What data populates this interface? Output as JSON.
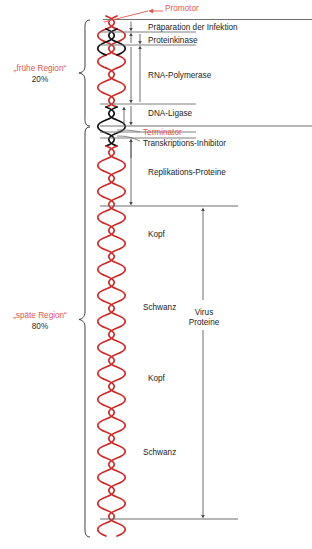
{
  "figure": {
    "type": "schematic-diagram",
    "caption": ""
  },
  "regions": [
    {
      "id": "early",
      "name": "„frühe Region“",
      "percent": "20%",
      "color": "#e0574f"
    },
    {
      "id": "late",
      "name": "„späte Region“",
      "percent": "80%",
      "color": "#e0574f"
    }
  ],
  "signals": [
    {
      "id": "promotor",
      "label": "Promotor",
      "color": "#e0574f"
    },
    {
      "id": "terminator",
      "label": "Terminator",
      "color": "#e0574f"
    }
  ],
  "gene_labels": [
    {
      "id": "praeparation",
      "label": "Präparation der Infektion"
    },
    {
      "id": "proteinkinase",
      "label": "Proteinkinase"
    },
    {
      "id": "rna-polymerase",
      "label": "RNA-Polymerase"
    },
    {
      "id": "dna-ligase",
      "label": "DNA-Ligase"
    },
    {
      "id": "transkriptions-inhibitor",
      "label": "Transkriptions-Inhibitor"
    },
    {
      "id": "replikations-proteine",
      "label": "Replikations-Proteine"
    },
    {
      "id": "kopf-1",
      "label": "Kopf"
    },
    {
      "id": "schwanz-1",
      "label": "Schwanz"
    },
    {
      "id": "kopf-2",
      "label": "Kopf"
    },
    {
      "id": "schwanz-2",
      "label": "Schwanz"
    }
  ],
  "bracket_labels": [
    {
      "id": "virus-proteine",
      "line1": "Virus",
      "line2": "Proteine"
    }
  ],
  "colors": {
    "dna_red": "#cc2a28",
    "dna_black": "#111111",
    "rule": "#6f6f6f",
    "accent_red": "#e0574f",
    "text": "#1d1d1d"
  }
}
